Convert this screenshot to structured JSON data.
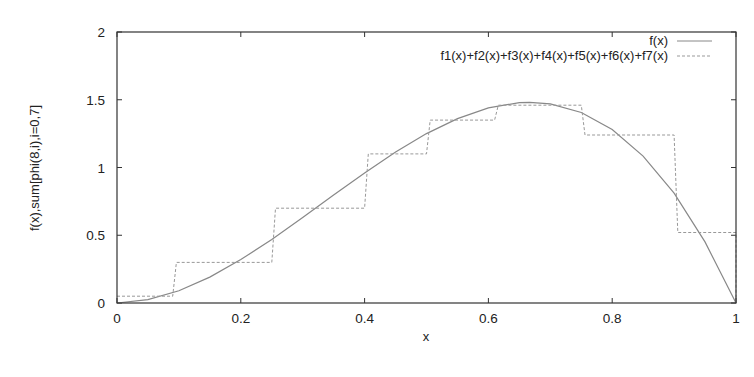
{
  "chart_data": {
    "type": "line",
    "title": "",
    "xlabel": "x",
    "ylabel": "f(x),sum[phi(8,i),i=0,7]",
    "xlim": [
      0,
      1
    ],
    "ylim": [
      0,
      2
    ],
    "grid": false,
    "legend_position": "top-right",
    "x_ticks": [
      "0",
      "0.2",
      "0.4",
      "0.6",
      "0.8",
      "1"
    ],
    "y_ticks": [
      "0",
      "0.5",
      "1",
      "1.5",
      "2"
    ],
    "series": [
      {
        "name": "f(x)",
        "style": "solid",
        "color": "#888888",
        "x": [
          0,
          0.05,
          0.1,
          0.15,
          0.2,
          0.25,
          0.3,
          0.35,
          0.4,
          0.45,
          0.5,
          0.55,
          0.6,
          0.65,
          0.6667,
          0.7,
          0.75,
          0.8,
          0.85,
          0.9,
          0.95,
          1.0
        ],
        "values": [
          0,
          0.024,
          0.09,
          0.191,
          0.32,
          0.469,
          0.63,
          0.796,
          0.96,
          1.114,
          1.25,
          1.361,
          1.44,
          1.479,
          1.481,
          1.47,
          1.406,
          1.28,
          1.084,
          0.81,
          0.451,
          0
        ]
      },
      {
        "name": "f1(x)+f2(x)+f3(x)+f4(x)+f5(x)+f6(x)+f7(x)",
        "style": "dashed",
        "color": "#888888",
        "type": "step",
        "breaks": [
          0,
          0.09,
          0.25,
          0.4,
          0.5,
          0.61,
          0.75,
          0.9,
          1.0
        ],
        "values": [
          0.05,
          0.3,
          0.7,
          1.1,
          1.35,
          1.46,
          1.24,
          0.52
        ]
      }
    ]
  }
}
